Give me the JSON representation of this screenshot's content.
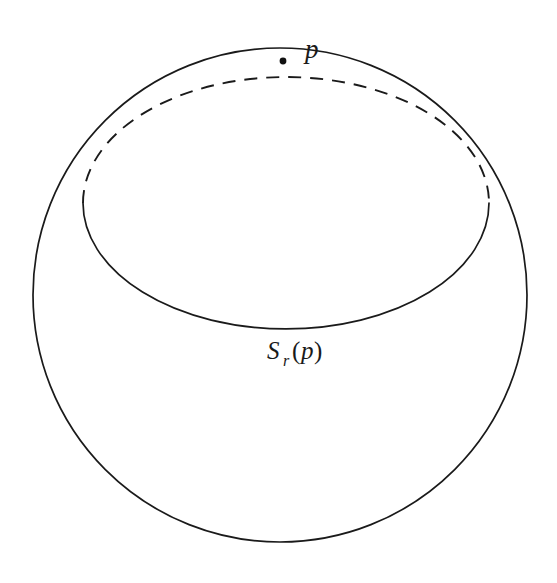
{
  "figure": {
    "kind": "geometry-diagram",
    "background_color": "#ffffff",
    "stroke_color": "#1a1a1a",
    "stroke_width": 1.6,
    "labels": {
      "point_label": "p",
      "sphere_label_base": "S",
      "sphere_label_subscript": "r",
      "sphere_label_open_paren": "(",
      "sphere_label_argument": "p",
      "sphere_label_close_paren": ")",
      "sphere_label_full": "S_r(p)"
    },
    "geometry": {
      "outer_sphere": {
        "shape": "circle",
        "cx": 280,
        "cy": 295,
        "r": 247
      },
      "geodesic_circle": {
        "shape": "ellipse",
        "cx": 286,
        "cy": 203,
        "rx": 203,
        "ry": 126,
        "front_arc_style": "solid",
        "back_arc_style": "dashed",
        "dash_pattern": "13 9"
      },
      "marked_point": {
        "label": "p",
        "x": 283,
        "y": 61,
        "dot_radius": 3.4
      },
      "label_positions": {
        "p_label_x": 305,
        "p_label_y": 56,
        "sr_label_x": 267,
        "sr_label_y": 359
      }
    }
  }
}
